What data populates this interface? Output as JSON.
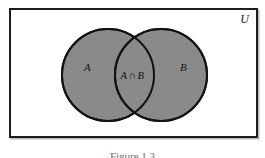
{
  "figure": {
    "kind": "venn-diagram",
    "width": 265,
    "height": 158,
    "universe_label": "U",
    "caption": "Figure 1.3"
  },
  "sets": {
    "a_label": "A",
    "b_label": "B",
    "intersection_left": "A",
    "intersection_operator": "∩",
    "intersection_right": "B",
    "intersection_label": "A ∩ B"
  },
  "colors": {
    "page_background": "#ffffff",
    "universe_fill": "#ffffff",
    "universe_border": "#1d1d1d",
    "universe_shadow": "#b9b9b9",
    "circle_fill": "#8a8a8a",
    "circle_stroke": "#121212",
    "label_text": "#121212",
    "caption_text": "#6e6e6e"
  },
  "geometry": {
    "universe": {
      "x": 9,
      "y": 8,
      "width": 249,
      "height": 130,
      "stroke_width": 2
    },
    "circle_a": {
      "cx": 108,
      "cy": 75,
      "r": 46
    },
    "circle_b": {
      "cx": 161,
      "cy": 75,
      "r": 46
    },
    "circle_stroke_width": 2
  }
}
